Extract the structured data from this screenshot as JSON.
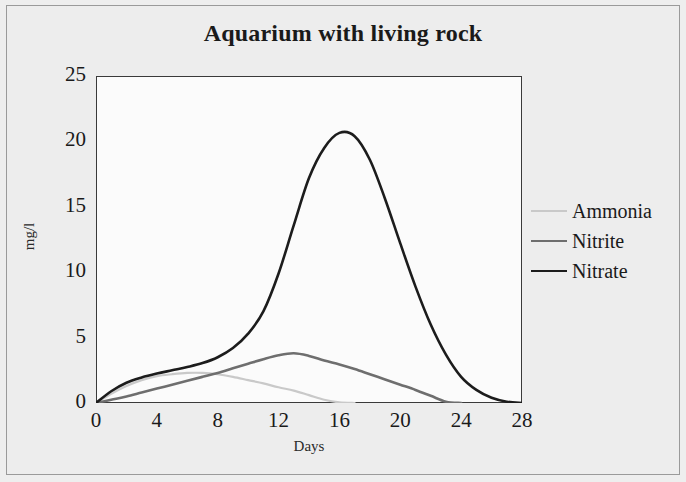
{
  "figure": {
    "background_color": "#ededed",
    "plot_background_color": "#fbfbfb",
    "frame_color": "#9a9a9a",
    "axis_color": "#3a3a3a"
  },
  "chart_data": {
    "type": "line",
    "title": "Aquarium with living rock",
    "xlabel": "Days",
    "ylabel": "mg/l",
    "xlim": [
      0,
      28
    ],
    "ylim": [
      0,
      25
    ],
    "xticks": [
      0,
      4,
      8,
      12,
      16,
      20,
      24,
      28
    ],
    "yticks": [
      0,
      5,
      10,
      15,
      20,
      25
    ],
    "grid": false,
    "legend_position": "right",
    "x": [
      0,
      1,
      2,
      3,
      4,
      5,
      6,
      7,
      8,
      9,
      10,
      11,
      12,
      13,
      14,
      15,
      16,
      17,
      18,
      19,
      20,
      21,
      22,
      23,
      24,
      25,
      26,
      27,
      28
    ],
    "series": [
      {
        "name": "Ammonia",
        "color": "#c9c9c9",
        "width": 2.2,
        "values": [
          0,
          0.7,
          1.3,
          1.75,
          2.05,
          2.2,
          2.3,
          2.3,
          2.2,
          2.0,
          1.75,
          1.5,
          1.2,
          0.95,
          0.6,
          0.25,
          0.05,
          0,
          0,
          0,
          0,
          0,
          0,
          0,
          0,
          0,
          0,
          0,
          0
        ]
      },
      {
        "name": "Nitrite",
        "color": "#6e6e6e",
        "width": 2.6,
        "values": [
          0,
          0.25,
          0.5,
          0.8,
          1.1,
          1.4,
          1.7,
          2.0,
          2.3,
          2.65,
          3.0,
          3.35,
          3.65,
          3.8,
          3.6,
          3.25,
          2.95,
          2.6,
          2.2,
          1.8,
          1.4,
          1.0,
          0.55,
          0.1,
          0,
          0,
          0,
          0,
          0
        ]
      },
      {
        "name": "Nitrate",
        "color": "#1c1c1c",
        "width": 2.6,
        "values": [
          0,
          0.9,
          1.55,
          1.95,
          2.25,
          2.5,
          2.75,
          3.05,
          3.5,
          4.2,
          5.3,
          7.0,
          9.9,
          13.6,
          17.2,
          19.5,
          20.65,
          20.4,
          18.6,
          15.6,
          12.2,
          8.9,
          6.0,
          3.7,
          2.0,
          1.0,
          0.4,
          0.1,
          0
        ]
      }
    ],
    "peaks": {
      "ammonia_peak_value": 2.3,
      "ammonia_peak_day": 7,
      "nitrite_peak_value": 3.8,
      "nitrite_peak_day": 13,
      "nitrate_peak_value": 20.7,
      "nitrate_peak_day": 16
    }
  }
}
